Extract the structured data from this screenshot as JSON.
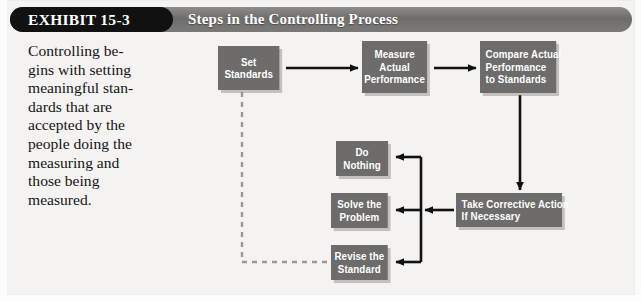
{
  "exhibit": {
    "tag": "EXHIBIT 15-3",
    "title": "Steps in the Controlling Process"
  },
  "caption": {
    "lines": [
      "Controlling be-",
      "gins with setting",
      "meaningful stan-",
      "dards that are",
      "accepted by the",
      "people doing the",
      "measuring and",
      "those being",
      "measured."
    ]
  },
  "flowchart": {
    "type": "process-flow-diagram",
    "nodes": [
      {
        "id": "set-standards",
        "lines": [
          "Set",
          "Standards"
        ],
        "align": "center",
        "x": 218,
        "y": 46,
        "w": 66,
        "h": 44
      },
      {
        "id": "measure",
        "lines": [
          "Measure",
          "Actual",
          "Performance"
        ],
        "align": "center",
        "x": 362,
        "y": 41,
        "w": 70,
        "h": 52
      },
      {
        "id": "compare",
        "lines": [
          "Compare Actual",
          "Performance",
          "to Standards"
        ],
        "align": "left",
        "x": 480,
        "y": 41,
        "w": 82,
        "h": 52
      },
      {
        "id": "take-action",
        "lines": [
          "Take Corrective Action",
          "If Necessary"
        ],
        "align": "left",
        "x": 456,
        "y": 193,
        "w": 114,
        "h": 34
      },
      {
        "id": "do-nothing",
        "lines": [
          "Do",
          "Nothing"
        ],
        "align": "center",
        "x": 336,
        "y": 141,
        "w": 56,
        "h": 35
      },
      {
        "id": "solve-problem",
        "lines": [
          "Solve the",
          "Problem"
        ],
        "align": "center",
        "x": 331,
        "y": 193,
        "w": 61,
        "h": 35
      },
      {
        "id": "revise-standard",
        "lines": [
          "Revise the",
          "Standard"
        ],
        "align": "center",
        "x": 331,
        "y": 245,
        "w": 61,
        "h": 35
      }
    ],
    "edges": [
      {
        "id": "set-to-measure",
        "from": "set-standards",
        "to": "measure",
        "style": "solid",
        "arrow": true
      },
      {
        "id": "measure-to-compare",
        "from": "measure",
        "to": "compare",
        "style": "solid",
        "arrow": true
      },
      {
        "id": "compare-to-action",
        "from": "compare",
        "to": "take-action",
        "style": "solid",
        "arrow": true
      },
      {
        "id": "action-to-branch",
        "from": "take-action",
        "to": "branch-trunk",
        "style": "solid",
        "arrow": true
      },
      {
        "id": "branch-to-nothing",
        "from": "branch-trunk",
        "to": "do-nothing",
        "style": "solid",
        "arrow": true
      },
      {
        "id": "branch-to-solve",
        "from": "branch-trunk",
        "to": "solve-problem",
        "style": "solid",
        "arrow": true
      },
      {
        "id": "branch-to-revise",
        "from": "branch-trunk",
        "to": "revise-standard",
        "style": "solid",
        "arrow": true
      },
      {
        "id": "set-to-revise-feedback",
        "from": "set-standards",
        "to": "revise-standard",
        "style": "dashed",
        "arrow": false
      }
    ]
  },
  "colors": {
    "node_fill": "#6d6c6a",
    "node_text": "#ffffff",
    "banner": "#7a7977",
    "tag_fill": "#111111",
    "wire": "#111111",
    "background": "#f4f3f1"
  }
}
